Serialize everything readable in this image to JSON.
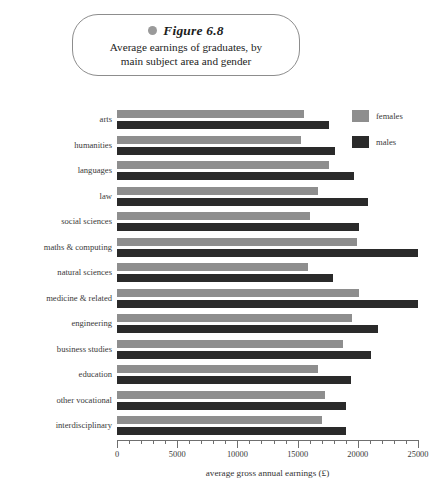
{
  "figure": {
    "bullet_icon": "filled-circle-icon",
    "label": "Figure 6.8",
    "caption_line1": "Average earnings of graduates, by",
    "caption_line2": "main subject area and gender"
  },
  "legend": {
    "position": "top-right",
    "entries": [
      {
        "name": "females",
        "color": "#8e8e8e"
      },
      {
        "name": "males",
        "color": "#2a2a2a"
      }
    ]
  },
  "colors": {
    "females": "#8e8e8e",
    "males": "#2a2a2a",
    "axis": "#6f6f6f",
    "text": "#3a3a3a",
    "callout_border": "#8d8d8d"
  },
  "chart_data": {
    "type": "bar",
    "orientation": "horizontal",
    "xlabel": "average gross annual earnings (£)",
    "ylabel": "",
    "xlim": [
      0,
      25000
    ],
    "xticks": [
      0,
      5000,
      10000,
      15000,
      20000,
      25000
    ],
    "xticklabels": [
      "0",
      "5000",
      "10000",
      "15000",
      "20000",
      "25000"
    ],
    "minor_tick_step": 1000,
    "grid": false,
    "legend": [
      "females",
      "males"
    ],
    "legend_position": "top right",
    "categories": [
      "arts",
      "humanities",
      "languages",
      "law",
      "social sciences",
      "maths & computing",
      "natural sciences",
      "medicine & related",
      "engineering",
      "business studies",
      "education",
      "other vocational",
      "interdisciplinary"
    ],
    "series": [
      {
        "name": "females",
        "color": "#8e8e8e",
        "values": [
          15500,
          15300,
          17600,
          16700,
          16000,
          19900,
          15900,
          20100,
          19500,
          18800,
          16700,
          17300,
          17000
        ]
      },
      {
        "name": "males",
        "color": "#2a2a2a",
        "values": [
          17600,
          18100,
          19700,
          20850,
          20100,
          25000,
          17950,
          25000,
          21700,
          21100,
          19400,
          19000,
          19000
        ]
      }
    ]
  }
}
